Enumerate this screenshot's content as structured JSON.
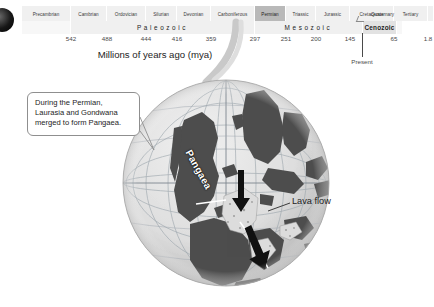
{
  "figure": {
    "corner_marker": "bullet-dot"
  },
  "timeline": {
    "periods": [
      {
        "label": "Precambrian",
        "w": 49,
        "highlight": false
      },
      {
        "label": "Cambrian",
        "w": 36,
        "highlight": false
      },
      {
        "label": "Ordovician",
        "w": 39,
        "highlight": false
      },
      {
        "label": "Silurian",
        "w": 31,
        "highlight": false
      },
      {
        "label": "Devonian",
        "w": 34,
        "highlight": false
      },
      {
        "label": "Carboniferous",
        "w": 44,
        "highlight": false
      },
      {
        "label": "Permian",
        "w": 31,
        "highlight": true
      },
      {
        "label": "Triassic",
        "w": 30,
        "highlight": false
      },
      {
        "label": "Jurassic",
        "w": 34,
        "highlight": false
      },
      {
        "label": "Cretaceous",
        "w": 44,
        "highlight": false
      },
      {
        "label": "Tertiary",
        "w": 34,
        "highlight": false
      },
      {
        "label": "",
        "w": 6,
        "highlight": false
      }
    ],
    "quaternary_label": "Quaternary",
    "eras": [
      {
        "label": "",
        "w": 49,
        "style": "blank"
      },
      {
        "label": "Paleozoic",
        "w": 184,
        "style": "spaced"
      },
      {
        "label": "Mesozoic",
        "w": 108,
        "style": "spaced"
      },
      {
        "label": "Cenozoic",
        "w": 34,
        "style": "bold"
      },
      {
        "label": "",
        "w": 6,
        "style": "blank"
      }
    ],
    "scale_values": [
      {
        "value": "542",
        "x": 49
      },
      {
        "value": "488",
        "x": 85
      },
      {
        "value": "444",
        "x": 124
      },
      {
        "value": "416",
        "x": 155
      },
      {
        "value": "359",
        "x": 189
      },
      {
        "value": "297",
        "x": 233
      },
      {
        "value": "251",
        "x": 264
      },
      {
        "value": "200",
        "x": 294
      },
      {
        "value": "145",
        "x": 328
      },
      {
        "value": "65",
        "x": 372
      },
      {
        "value": "1.8",
        "x": 406
      }
    ],
    "present_label": "Present",
    "axis_title": "Millions of years ago (mya)"
  },
  "callout": {
    "text": "During the Permian, Laurasia and Gondwana merged to form Pangaea."
  },
  "map": {
    "continent_label": "Pangaea",
    "lava_label": "Lava flow"
  },
  "colors": {
    "highlight_band": "#b9b9b9",
    "band_background": "#f0f0f0",
    "land_dark": "#4a4a4a",
    "ocean_light": "#d8d8d8",
    "graticule": "#9aa3ab",
    "text": "#1d1d1d"
  }
}
